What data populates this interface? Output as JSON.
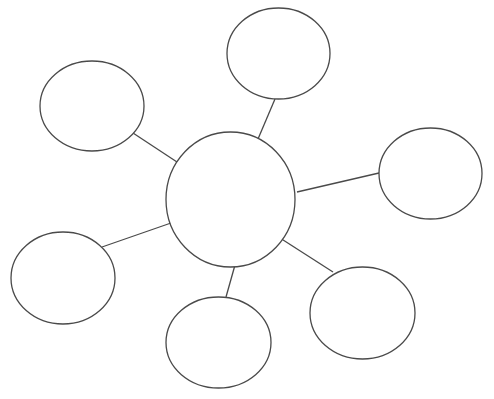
{
  "diagram": {
    "type": "bubble-map",
    "canvas": {
      "width": 494,
      "height": 399,
      "background": "#ffffff"
    },
    "stroke_color": "#4a4a4a",
    "center_node": {
      "id": "center",
      "label": "",
      "cx": 230.5,
      "cy": 199.5,
      "rx": 64.5,
      "ry": 67.5
    },
    "nodes": [
      {
        "id": "top-left",
        "label": "",
        "cx": 92,
        "cy": 106,
        "rx": 52,
        "ry": 45
      },
      {
        "id": "top",
        "label": "",
        "cx": 278.5,
        "cy": 53.5,
        "rx": 51.5,
        "ry": 45.5
      },
      {
        "id": "right",
        "label": "",
        "cx": 430.5,
        "cy": 173.5,
        "rx": 51.5,
        "ry": 45.5
      },
      {
        "id": "bottom-right",
        "label": "",
        "cx": 362.5,
        "cy": 313,
        "rx": 52.5,
        "ry": 46
      },
      {
        "id": "bottom",
        "label": "",
        "cx": 218.5,
        "cy": 342.5,
        "rx": 52.5,
        "ry": 45.5
      },
      {
        "id": "left",
        "label": "",
        "cx": 63,
        "cy": 278,
        "rx": 52,
        "ry": 46
      }
    ],
    "edges": [
      {
        "from": "center",
        "to": "top-left",
        "x1": 177,
        "y1": 162,
        "x2": 133,
        "y2": 133
      },
      {
        "from": "center",
        "to": "top",
        "x1": 258,
        "y1": 139,
        "x2": 275,
        "y2": 99
      },
      {
        "from": "center",
        "to": "right",
        "x1": 297,
        "y1": 192,
        "x2": 379,
        "y2": 173
      },
      {
        "from": "center",
        "to": "bottom-right",
        "x1": 280,
        "y1": 238,
        "x2": 333,
        "y2": 272
      },
      {
        "from": "center",
        "to": "bottom",
        "x1": 235,
        "y1": 265,
        "x2": 226,
        "y2": 297
      },
      {
        "from": "center",
        "to": "left",
        "x1": 171,
        "y1": 223,
        "x2": 102,
        "y2": 247
      }
    ]
  }
}
